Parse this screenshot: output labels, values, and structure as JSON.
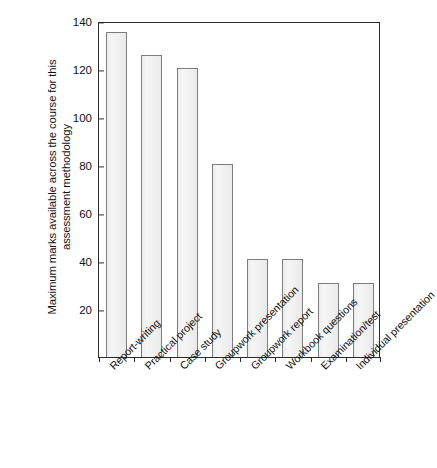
{
  "chart_data": {
    "type": "bar",
    "title": "",
    "subtitle": "",
    "xlabel": "",
    "ylabel": "Maximum marks available across the course for this assessment methodology",
    "ylabel_lines": [
      "Maximum marks available across the course for this",
      "assessment methodology"
    ],
    "categories": [
      "Report-writing",
      "Practical project",
      "Case study",
      "Groupwork presentation",
      "Groupwork report",
      "Workbook questions",
      "Examination/test",
      "Individual presentation"
    ],
    "values": [
      135.5,
      126,
      120.5,
      80.5,
      41,
      41,
      31,
      31
    ],
    "ylim": [
      0,
      140
    ],
    "yticks": [
      20,
      40,
      60,
      80,
      100,
      120,
      140
    ],
    "ytick_labels": [
      "20",
      "40",
      "60",
      "80",
      "100",
      "120",
      "140"
    ],
    "grid": false,
    "legend": false,
    "legend_position": "none",
    "bar_fill_color": "#f1f1f1",
    "bar_border_color": "#7d7d7d",
    "axis_color": "#2b2b2b",
    "background_color": "#ffffff",
    "text_color": "#111111"
  }
}
